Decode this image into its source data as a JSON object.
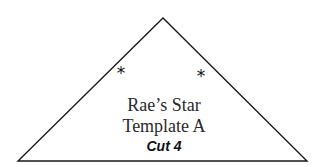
{
  "template": {
    "title_line1": "Rae’s Star",
    "title_line2": "Template A",
    "instruction": "Cut 4",
    "markers": [
      "*",
      "*"
    ],
    "shape": "triangle",
    "stroke_color": "#1a1a1a",
    "background": "#ffffff"
  }
}
